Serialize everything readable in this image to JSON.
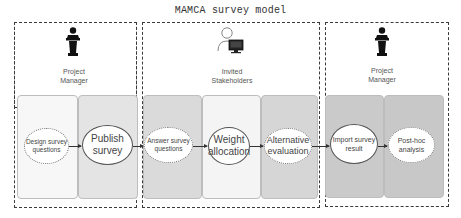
{
  "title": "MAMCA survey model",
  "groups": [
    {
      "role": "Project Manager",
      "icon": "podium-speaker-icon"
    },
    {
      "role": "Invited Stakeholders",
      "icon": "user-computer-icon"
    },
    {
      "role": "Project Manager",
      "icon": "podium-speaker-icon"
    }
  ],
  "role_lines": {
    "pm1": [
      "Project",
      "Manager"
    ],
    "st": [
      "Invited",
      "Stakeholders"
    ],
    "pm2": [
      "Project",
      "Manager"
    ]
  },
  "steps": [
    {
      "label_lines": [
        "Design survey",
        "questions"
      ],
      "style": "dotted"
    },
    {
      "label_lines": [
        "Publish",
        "survey"
      ],
      "style": "solid"
    },
    {
      "label_lines": [
        "Answer survey",
        "questions"
      ],
      "style": "dotted"
    },
    {
      "label_lines": [
        "Weight",
        "allocation"
      ],
      "style": "solid"
    },
    {
      "label_lines": [
        "Alternative",
        "evaluation"
      ],
      "style": "dotted"
    },
    {
      "label_lines": [
        "Import survey",
        "result"
      ],
      "style": "solid"
    },
    {
      "label_lines": [
        "Post-hoc",
        "analysis"
      ],
      "style": "dotted"
    }
  ],
  "colors": {
    "lane_1": "#f7f7f7",
    "lane_2": "#e4e4e4",
    "lane_3": "#dadada",
    "lane_4": "#f4f4f4",
    "lane_5": "#d6d6d6",
    "lane_6": "#cacaca",
    "lane_7": "#c8c8c8",
    "dashed_border": "#3a3a3a"
  }
}
